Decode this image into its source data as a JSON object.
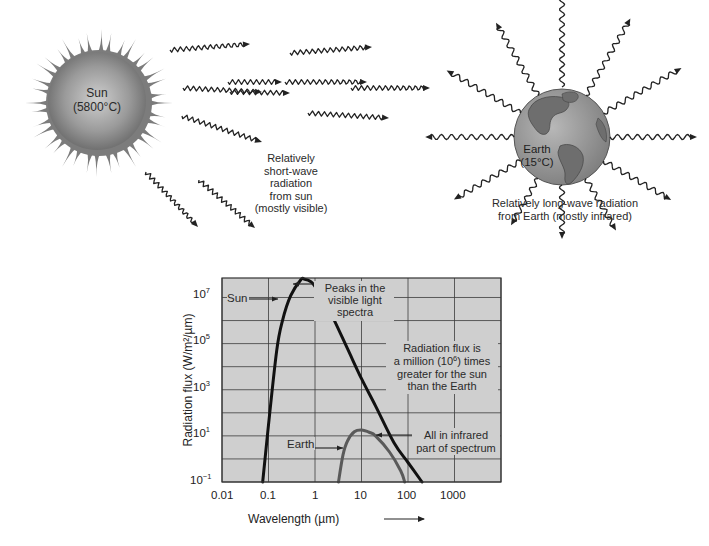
{
  "sun": {
    "name": "Sun",
    "temp": "(5800°C)",
    "radiation_caption": [
      "Relatively",
      "short-wave",
      "radiation",
      "from sun",
      "(mostly visible)"
    ]
  },
  "earth": {
    "name": "Earth",
    "temp": "(15°C)",
    "radiation_caption": [
      "Relatively long-wave radiation",
      "from Earth (mostly infrared)"
    ]
  },
  "colors": {
    "sun_body": "#8a8a8a",
    "sun_rays": "#7c7c7c",
    "earth_ocean": "#9a9a9a",
    "earth_land": "#6e6e6e",
    "chart_bg": "#cfcfcf",
    "grid": "#3a3a3a",
    "sun_curve": "#111111",
    "earth_curve": "#5a5a5a"
  },
  "chart_data": {
    "type": "line",
    "title": "",
    "xlabel": "Wavelength (µm)",
    "ylabel": "Radiation flux (W/m²/µm)",
    "x_scale": "log",
    "y_scale": "log",
    "xlim": [
      0.01,
      10000
    ],
    "ylim": [
      0.1,
      70000000
    ],
    "x_ticks": [
      "0.01",
      "0.1",
      "1",
      "10",
      "100",
      "1000"
    ],
    "y_ticks": [
      "10^-1",
      "10^1",
      "10^3",
      "10^5",
      "10^7"
    ],
    "grid": true,
    "legend": "inline annotations",
    "series": [
      {
        "name": "Sun",
        "x": [
          0.075,
          0.1,
          0.15,
          0.2,
          0.3,
          0.5,
          0.6,
          0.8,
          1,
          2,
          5,
          10,
          20,
          50,
          100,
          200
        ],
        "y": [
          0.1,
          30,
          50000,
          1000000,
          12000000,
          60000000,
          62000000,
          50000000,
          30000000,
          3000000,
          60000,
          3000,
          200,
          5,
          0.7,
          0.1
        ]
      },
      {
        "name": "Earth",
        "x": [
          3.2,
          4,
          5,
          7,
          10,
          15,
          20,
          40,
          70,
          85
        ],
        "y": [
          0.1,
          1.5,
          6,
          15,
          18,
          14,
          10,
          2,
          0.3,
          0.1
        ]
      }
    ],
    "annotations": [
      {
        "text": "Sun",
        "points_to": "Sun curve"
      },
      {
        "text": "Peaks in the visible light spectra",
        "points_to": "Sun peak near 0.5 µm"
      },
      {
        "text": "Radiation flux is a million (10^6) times greater for the sun than the Earth"
      },
      {
        "text": "Earth",
        "points_to": "Earth curve"
      },
      {
        "text": "All in infrared part of spectrum",
        "points_to": "Earth peak near 10 µm"
      }
    ]
  },
  "chart_labels": {
    "sun_label": "Sun",
    "peaks_note": [
      "Peaks in the",
      "visible light",
      "spectra"
    ],
    "million_note_1": "Radiation flux is",
    "million_note_2a": "a million (10",
    "million_note_2sup": "6",
    "million_note_2b": ") times",
    "million_note_3": "greater for the sun",
    "million_note_4": "than the Earth",
    "earth_label": "Earth",
    "infrared_note": [
      "All in infrared",
      "part of spectrum"
    ],
    "xlabel": "Wavelength (µm)",
    "ylabel": "Radiation flux (W/m²/µm)",
    "x_ticks": [
      "0.01",
      "0.1",
      "1",
      "10",
      "100",
      "1000"
    ],
    "y_tick_base": "10",
    "y_tick_exps": [
      "7",
      "5",
      "3",
      "1",
      "−1"
    ]
  }
}
